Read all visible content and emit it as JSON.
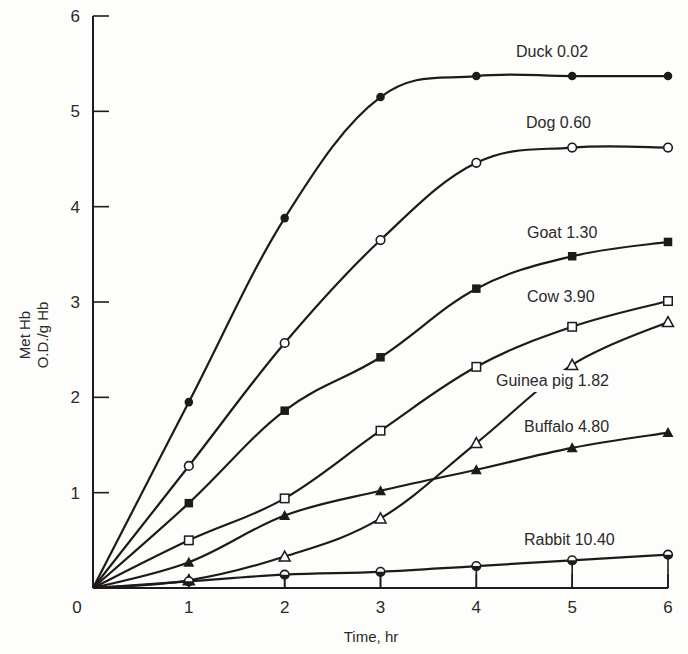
{
  "chart_data": {
    "type": "line",
    "title": "",
    "xlabel": "Time, hr",
    "ylabel": [
      "Met Hb",
      "O.D./g Hb"
    ],
    "xlim": [
      0,
      6
    ],
    "ylim": [
      0,
      6
    ],
    "x_ticks": [
      0,
      1,
      2,
      3,
      4,
      5,
      6
    ],
    "y_ticks": [
      1,
      2,
      3,
      4,
      5,
      6
    ],
    "x_tick_labels": [
      "0",
      "1",
      "2",
      "3",
      "4",
      "5",
      "6"
    ],
    "y_tick_labels": [
      "1",
      "2",
      "3",
      "4",
      "5",
      "6"
    ],
    "grid": false,
    "legend_position": "inline labels at right end of each curve",
    "x": [
      0,
      1,
      2,
      3,
      4,
      5,
      6
    ],
    "series": [
      {
        "name": "Duck",
        "value_label": "0.02",
        "label": "Duck 0.02",
        "marker": "filled-circle",
        "values": [
          0,
          1.95,
          3.88,
          5.15,
          5.37,
          5.37,
          5.37
        ],
        "label_pos": [
          516,
          57
        ]
      },
      {
        "name": "Dog",
        "value_label": "0.60",
        "label": "Dog 0.60",
        "marker": "open-circle",
        "values": [
          0,
          1.28,
          2.57,
          3.65,
          4.46,
          4.62,
          4.62
        ],
        "label_pos": [
          526,
          128
        ]
      },
      {
        "name": "Goat",
        "value_label": "1.30",
        "label": "Goat 1.30",
        "marker": "filled-square",
        "values": [
          0,
          0.89,
          1.86,
          2.42,
          3.14,
          3.48,
          3.63
        ],
        "label_pos": [
          527,
          238
        ]
      },
      {
        "name": "Cow",
        "value_label": "3.90",
        "label": "Cow 3.90",
        "marker": "open-square",
        "values": [
          0,
          0.5,
          0.94,
          1.65,
          2.32,
          2.74,
          3.01
        ],
        "label_pos": [
          527,
          302
        ]
      },
      {
        "name": "Guinea pig",
        "value_label": "1.82",
        "label": "Guinea pig 1.82",
        "marker": "open-triangle",
        "values": [
          0,
          0.08,
          0.33,
          0.73,
          1.52,
          2.34,
          2.79
        ],
        "label_pos": [
          496,
          386
        ]
      },
      {
        "name": "Buffalo",
        "value_label": "4.80",
        "label": "Buffalo 4.80",
        "marker": "filled-triangle",
        "values": [
          0,
          0.27,
          0.76,
          1.02,
          1.24,
          1.47,
          1.63
        ],
        "label_pos": [
          524,
          432
        ]
      },
      {
        "name": "Rabbit",
        "value_label": "10.40",
        "label": "Rabbit 10.40",
        "marker": "half-filled-circle",
        "values": [
          0,
          0.07,
          0.14,
          0.17,
          0.23,
          0.29,
          0.35
        ],
        "label_pos": [
          524,
          545
        ]
      }
    ]
  },
  "layout": {
    "plot_left": 93,
    "plot_right": 668,
    "plot_top": 16,
    "plot_bottom": 588
  }
}
